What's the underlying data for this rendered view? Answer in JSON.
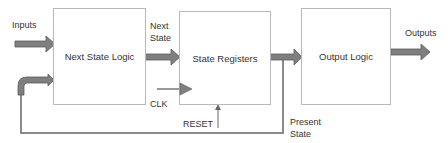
{
  "diagram": {
    "blocks": [
      {
        "id": "next_state_logic",
        "label": "Next State Logic"
      },
      {
        "id": "state_registers",
        "label": "State Registers"
      },
      {
        "id": "output_logic",
        "label": "Output Logic"
      }
    ],
    "labels": {
      "inputs": "Inputs",
      "next_state": "Next\nState",
      "clk": "CLK",
      "reset": "RESET",
      "present_state": "Present\nState",
      "outputs": "Outputs"
    },
    "edges": [
      {
        "from": "Inputs",
        "to": "Next State Logic",
        "style": "block-arrow"
      },
      {
        "from": "Next State Logic",
        "to": "State Registers",
        "label": "Next State",
        "style": "block-arrow"
      },
      {
        "from": "CLK",
        "to": "State Registers",
        "style": "clock-triangle"
      },
      {
        "from": "RESET",
        "to": "State Registers",
        "style": "thin-arrow"
      },
      {
        "from": "State Registers",
        "to": "Output Logic",
        "style": "block-arrow"
      },
      {
        "from": "State Registers",
        "to": "Next State Logic",
        "label": "Present State",
        "style": "feedback"
      },
      {
        "from": "Output Logic",
        "to": "Outputs",
        "style": "block-arrow"
      }
    ],
    "colors": {
      "arrow_fill": "#7f7f7f",
      "arrow_stroke": "#5a5a5a",
      "box_border": "#b8b8b8",
      "text": "#333333"
    }
  }
}
